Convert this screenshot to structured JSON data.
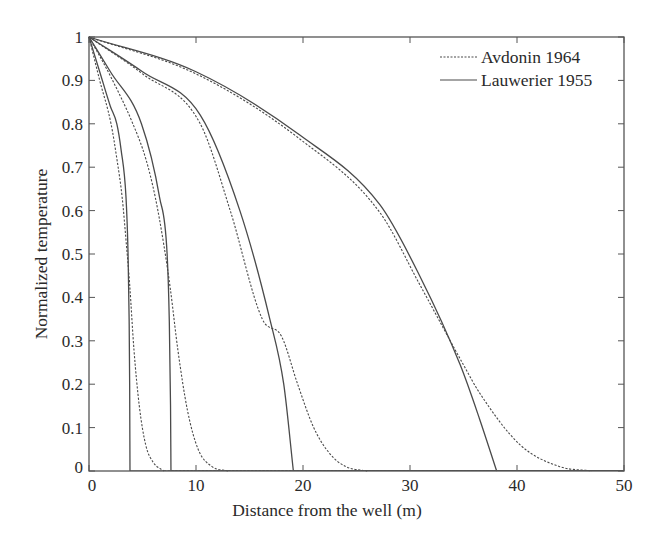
{
  "chart_data": {
    "type": "line",
    "title": "",
    "xlabel": "Distance from the well (m)",
    "ylabel": "Normalized temperature",
    "xlim": [
      0,
      50
    ],
    "ylim": [
      0,
      1
    ],
    "x_ticks": [
      0,
      10,
      20,
      30,
      40,
      50
    ],
    "x_tick_labels": [
      "0",
      "10",
      "20",
      "30",
      "40",
      "50"
    ],
    "y_ticks": [
      0,
      0.1,
      0.2,
      0.3,
      0.4,
      0.5,
      0.6,
      0.7,
      0.8,
      0.9,
      1
    ],
    "y_tick_labels": [
      "0",
      "0.1",
      "0.2",
      "0.3",
      "0.4",
      "0.5",
      "0.6",
      "0.7",
      "0.8",
      "0.9",
      "1"
    ],
    "grid": false,
    "legend_position": "upper right",
    "legend": [
      {
        "label": "Avdonin 1964",
        "style": "dashed"
      },
      {
        "label": "Lauwerier 1955",
        "style": "solid"
      }
    ],
    "colors": {
      "line": "#4a4a4a",
      "axis": "#555555",
      "text": "#2a2a2a"
    },
    "series": [
      {
        "name": "Avdonin 1964",
        "group": 1,
        "style": "dashed",
        "x": [
          0,
          1,
          2.06,
          2.6,
          3.1,
          3.5,
          3.8,
          4.2,
          4.7,
          5.3,
          6,
          7
        ],
        "y": [
          1,
          0.9,
          0.8,
          0.72,
          0.63,
          0.52,
          0.43,
          0.28,
          0.15,
          0.06,
          0.02,
          0
        ]
      },
      {
        "name": "Lauwerier 1955",
        "group": 1,
        "style": "solid",
        "x": [
          0,
          1,
          2,
          2.6,
          3.0,
          3.46,
          3.65,
          3.75,
          3.8,
          3.83
        ],
        "y": [
          1,
          0.92,
          0.84,
          0.8,
          0.74,
          0.63,
          0.5,
          0.35,
          0.2,
          0
        ]
      },
      {
        "name": "Avdonin 1964",
        "group": 2,
        "style": "dashed",
        "x": [
          0,
          2,
          4.1,
          5.3,
          6.2,
          7.0,
          7.6,
          8.3,
          9.2,
          10.2,
          11.5,
          13
        ],
        "y": [
          1,
          0.91,
          0.8,
          0.72,
          0.63,
          0.52,
          0.42,
          0.28,
          0.14,
          0.05,
          0.01,
          0
        ]
      },
      {
        "name": "Lauwerier 1955",
        "group": 2,
        "style": "solid",
        "x": [
          0,
          2,
          4.9,
          6.6,
          7.3,
          7.5,
          7.62,
          7.66
        ],
        "y": [
          1,
          0.92,
          0.8,
          0.63,
          0.5,
          0.35,
          0.15,
          0
        ]
      },
      {
        "name": "Avdonin 1964",
        "group": 3,
        "style": "dashed",
        "x": [
          0,
          5,
          10.4,
          13.2,
          16.2,
          18,
          19.5,
          21,
          22.5,
          24,
          26
        ],
        "y": [
          1,
          0.915,
          0.8,
          0.6,
          0.35,
          0.31,
          0.2,
          0.1,
          0.04,
          0.01,
          0
        ]
      },
      {
        "name": "Lauwerier 1955",
        "group": 3,
        "style": "solid",
        "x": [
          0,
          5,
          10.4,
          14.1,
          16.9,
          18.2,
          19.1
        ],
        "y": [
          1,
          0.92,
          0.82,
          0.6,
          0.35,
          0.2,
          0
        ]
      },
      {
        "name": "Avdonin 1964",
        "group": 4,
        "style": "dashed",
        "x": [
          0,
          10,
          19.7,
          27.2,
          30.9,
          35.1,
          36.5,
          40.3,
          44,
          47
        ],
        "y": [
          1,
          0.915,
          0.765,
          0.595,
          0.43,
          0.24,
          0.18,
          0.06,
          0.01,
          0
        ]
      },
      {
        "name": "Lauwerier 1955",
        "group": 4,
        "style": "solid",
        "x": [
          0,
          10,
          19.7,
          27.2,
          30.9,
          34.7,
          36.5,
          38.1
        ],
        "y": [
          1,
          0.92,
          0.774,
          0.613,
          0.45,
          0.244,
          0.12,
          0
        ]
      }
    ]
  }
}
